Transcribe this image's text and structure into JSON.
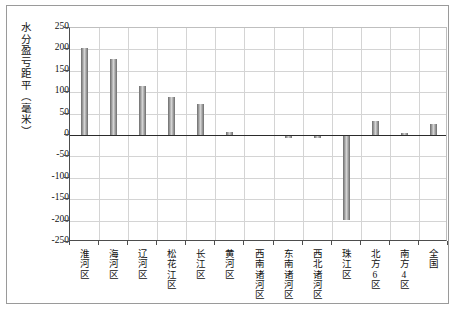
{
  "chart_data": {
    "type": "bar",
    "title": "",
    "subtitle": "",
    "xlabel": "",
    "ylabel": "水分盈亏距平（毫米）",
    "ylim": [
      -250,
      250
    ],
    "ytick_step": 50,
    "yticks": [
      "250",
      "200",
      "150",
      "100",
      "50",
      "0",
      "-50",
      "-100",
      "-150",
      "-200",
      "-250"
    ],
    "ytick_values": [
      250,
      200,
      150,
      100,
      50,
      0,
      -50,
      -100,
      -150,
      -200,
      -250
    ],
    "grid": true,
    "legend": null,
    "legend_position": "none",
    "bar_color": "#b0b0b0",
    "bar_edge_color": "#7a7a7a",
    "zero_line_color": "#2b2b2b",
    "grid_color": "#d4d4d4",
    "axis_color": "#4d4d4d",
    "categories": [
      "淮河区",
      "海河区",
      "辽河区",
      "松花江区",
      "长江区",
      "黄河区",
      "西南诸河区",
      "东南诸河区",
      "西北诸河区",
      "珠江区",
      "北方6区",
      "南方4区",
      "全国"
    ],
    "values": [
      203,
      177,
      115,
      88,
      72,
      8,
      1,
      -8,
      -7,
      -198,
      33,
      5,
      25
    ]
  }
}
